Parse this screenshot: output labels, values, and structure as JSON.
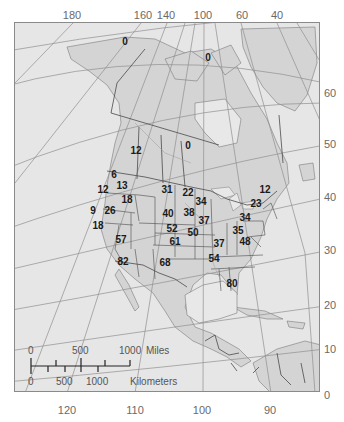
{
  "map": {
    "title": "",
    "longitude_labels_top": [
      {
        "text": "180",
        "x": 72
      },
      {
        "text": "160",
        "x": 143
      },
      {
        "text": "140",
        "x": 166
      },
      {
        "text": "100",
        "x": 203
      },
      {
        "text": "60",
        "x": 242
      },
      {
        "text": "40",
        "x": 277
      }
    ],
    "longitude_labels_bottom": [
      {
        "text": "120",
        "x": 67
      },
      {
        "text": "110",
        "x": 135
      },
      {
        "text": "100",
        "x": 202
      },
      {
        "text": "90",
        "x": 270
      }
    ],
    "latitude_labels_right": [
      {
        "text": "60",
        "y": 93
      },
      {
        "text": "50",
        "y": 144
      },
      {
        "text": "40",
        "y": 197
      },
      {
        "text": "30",
        "y": 250
      },
      {
        "text": "20",
        "y": 305
      },
      {
        "text": "10",
        "y": 349
      },
      {
        "text": "0",
        "y": 395
      }
    ],
    "region_values": [
      {
        "region": "alaska",
        "value": "0",
        "x": 125,
        "y": 42
      },
      {
        "region": "arctic-islands",
        "value": "0",
        "x": 208,
        "y": 58
      },
      {
        "region": "alberta-saskatchewan",
        "value": "12",
        "x": 136,
        "y": 151
      },
      {
        "region": "manitoba-ontario",
        "value": "0",
        "x": 188,
        "y": 146
      },
      {
        "region": "washington",
        "value": "6",
        "x": 114,
        "y": 175
      },
      {
        "region": "oregon",
        "value": "12",
        "x": 103,
        "y": 190
      },
      {
        "region": "idaho",
        "value": "13",
        "x": 122,
        "y": 186
      },
      {
        "region": "wyoming-idaho-south",
        "value": "18",
        "x": 127,
        "y": 200
      },
      {
        "region": "north-dakota-south-dakota",
        "value": "31",
        "x": 167,
        "y": 190
      },
      {
        "region": "minnesota",
        "value": "22",
        "x": 188,
        "y": 193
      },
      {
        "region": "michigan-wisconsin",
        "value": "34",
        "x": 201,
        "y": 202
      },
      {
        "region": "northern-california",
        "value": "9",
        "x": 93,
        "y": 211
      },
      {
        "region": "nevada",
        "value": "26",
        "x": 110,
        "y": 211
      },
      {
        "region": "southern-california",
        "value": "18",
        "x": 98,
        "y": 226
      },
      {
        "region": "nebraska",
        "value": "40",
        "x": 168,
        "y": 214
      },
      {
        "region": "iowa",
        "value": "38",
        "x": 189,
        "y": 213
      },
      {
        "region": "illinois-indiana",
        "value": "37",
        "x": 204,
        "y": 221
      },
      {
        "region": "kansas",
        "value": "52",
        "x": 172,
        "y": 229
      },
      {
        "region": "missouri",
        "value": "50",
        "x": 193,
        "y": 233
      },
      {
        "region": "arizona",
        "value": "57",
        "x": 121,
        "y": 240
      },
      {
        "region": "oklahoma",
        "value": "61",
        "x": 175,
        "y": 242
      },
      {
        "region": "tennessee",
        "value": "37",
        "x": 219,
        "y": 244
      },
      {
        "region": "north-carolina",
        "value": "48",
        "x": 245,
        "y": 242
      },
      {
        "region": "northern-mexico",
        "value": "82",
        "x": 123,
        "y": 262
      },
      {
        "region": "texas",
        "value": "68",
        "x": 165,
        "y": 263
      },
      {
        "region": "alabama-georgia",
        "value": "54",
        "x": 214,
        "y": 259
      },
      {
        "region": "maine",
        "value": "12",
        "x": 265,
        "y": 190
      },
      {
        "region": "new-england",
        "value": "23",
        "x": 256,
        "y": 204
      },
      {
        "region": "pennsylvania-new-york",
        "value": "34",
        "x": 245,
        "y": 218
      },
      {
        "region": "virginia",
        "value": "35",
        "x": 238,
        "y": 231
      },
      {
        "region": "florida",
        "value": "80",
        "x": 232,
        "y": 284
      }
    ],
    "scale_bar": {
      "miles_ticks": [
        {
          "text": "0",
          "x": 31
        },
        {
          "text": "500",
          "x": 81
        },
        {
          "text": "1000",
          "x": 129
        }
      ],
      "miles_unit": "Miles",
      "km_ticks": [
        {
          "text": "0",
          "x": 31
        },
        {
          "text": "500",
          "x": 65
        },
        {
          "text": "1000",
          "x": 98
        }
      ],
      "km_unit": "Kilometers"
    },
    "colors": {
      "land": "#d6d6d6",
      "water": "#e8e8e8",
      "grid": "#8f8f8f",
      "border": "#555555",
      "text": "#1a1a1a",
      "axis_text": "#6a6a6a"
    }
  }
}
